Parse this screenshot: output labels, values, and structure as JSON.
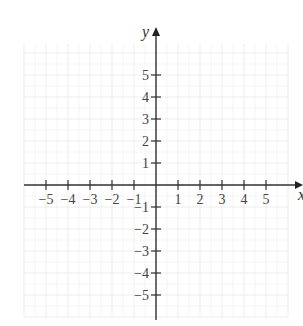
{
  "chart_data": {
    "type": "scatter",
    "title": "",
    "xlabel": "x",
    "ylabel": "y",
    "xlim": [
      -6,
      6
    ],
    "ylim": [
      -6,
      6
    ],
    "grid": true,
    "x_ticks": [
      -5,
      -4,
      -3,
      -2,
      -1,
      1,
      2,
      3,
      4,
      5
    ],
    "y_ticks": [
      5,
      4,
      3,
      2,
      1,
      -1,
      -2,
      -3,
      -4,
      -5
    ],
    "x_tick_labels": [
      "−5",
      "−4",
      "−3",
      "−2",
      "−1",
      "1",
      "2",
      "3",
      "4",
      "5"
    ],
    "y_tick_labels": [
      "5",
      "4",
      "3",
      "2",
      "1",
      "−1",
      "−2",
      "−3",
      "−4",
      "−5"
    ],
    "series": []
  },
  "axes": {
    "x_label": "x",
    "y_label": "y"
  },
  "colors": {
    "axis": "#333333",
    "grid": "#e8e8e8",
    "text": "#444444"
  }
}
